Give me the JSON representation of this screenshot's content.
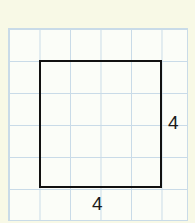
{
  "diagram": {
    "type": "square on grid",
    "grid": {
      "columns": 6,
      "rows": 6,
      "line_color": "#c9dbe8",
      "background": "#fbfdf8"
    },
    "shape": {
      "kind": "square",
      "width_units": 4,
      "height_units": 4,
      "stroke": "#111111"
    },
    "labels": {
      "right_side": "4",
      "bottom_side": "4"
    }
  }
}
